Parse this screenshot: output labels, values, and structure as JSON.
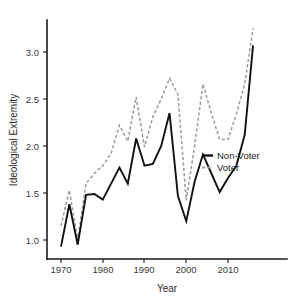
{
  "chart_data": {
    "type": "line",
    "title": "",
    "xlabel": "Year",
    "ylabel": "Ideological Extremity",
    "xlim": [
      1969,
      2017
    ],
    "ylim": [
      0.85,
      3.35
    ],
    "xticks": [
      1970,
      1980,
      1990,
      2000,
      2010
    ],
    "yticks": [
      1.0,
      1.5,
      2.0,
      2.5,
      3.0
    ],
    "xtick_labels": [
      "1970",
      "1980",
      "1990",
      "2000",
      "2010"
    ],
    "ytick_labels": [
      "1.0",
      "1.5",
      "2.0",
      "2.5",
      "3.0"
    ],
    "grid": false,
    "legend_position": "center-right",
    "x": [
      1970,
      1972,
      1974,
      1976,
      1978,
      1980,
      1982,
      1984,
      1986,
      1988,
      1990,
      1992,
      1994,
      1996,
      1998,
      2000,
      2002,
      2004,
      2006,
      2008,
      2010,
      2012,
      2014,
      2016
    ],
    "series": [
      {
        "name": "Non-Voter",
        "style": "solid",
        "color": "#111111",
        "values": [
          0.93,
          1.38,
          0.95,
          1.48,
          1.49,
          1.43,
          1.6,
          1.77,
          1.6,
          2.08,
          1.79,
          1.81,
          2.0,
          2.35,
          1.47,
          1.2,
          1.62,
          1.91,
          1.71,
          1.51,
          1.66,
          1.79,
          2.12,
          3.07
        ]
      },
      {
        "name": "Voter",
        "style": "dashed",
        "color": "#9a9a9a",
        "values": [
          1.15,
          1.53,
          1.0,
          1.6,
          1.71,
          1.79,
          1.92,
          2.22,
          2.05,
          2.52,
          1.99,
          2.31,
          2.5,
          2.72,
          2.55,
          1.42,
          2.0,
          2.66,
          2.35,
          2.07,
          2.07,
          2.34,
          2.66,
          3.25
        ]
      }
    ]
  },
  "legend": {
    "entries": [
      {
        "label": "Non-Voter",
        "marker": "solid-line-swatch"
      },
      {
        "label": "Voter",
        "marker": "dashed-line-swatch"
      }
    ]
  }
}
